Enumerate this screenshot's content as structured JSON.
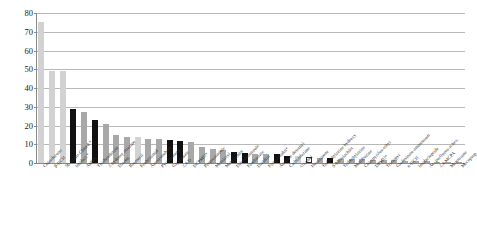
{
  "chart_data": {
    "type": "bar",
    "title": "",
    "subtitle": "",
    "xlabel": "",
    "ylabel": "",
    "ylim": [
      0,
      80
    ],
    "ytick_step": 10,
    "ytick_labels": [
      "0",
      "10",
      "20",
      "30",
      "40",
      "50",
      "60",
      "70",
      "80"
    ],
    "grid": true,
    "legend": "none",
    "colors": {
      "light": "#d2d2d2",
      "mid": "#a8a8a8",
      "dark": "#111111",
      "white": "#ffffff",
      "gridline": "#b9b9b9",
      "axis": "#8a8a8a"
    },
    "categories": [
      "Chlordecone",
      "β-HCH",
      "5b-hydro-Chlord.*",
      "Imidacl.*",
      "AMPA",
      "Thiabendazole",
      "2-hydroxy atrazine",
      "Diuron",
      "Bromacil",
      "Fenhexamid",
      "Azoxystrobine",
      "Pyrimethanil",
      "Glyphosate",
      "2,4-D",
      "DCPMU*",
      "Propiconazole",
      "Metalaxyl",
      "Metolachlor",
      "Difenoconazole",
      "Fosthiazate",
      "Dieldrin",
      "Flurprimidol*",
      "Atrazine desethyl",
      "Carbendazime",
      "Oxamyl",
      "Hexazinone",
      "Terbuthylazine hydroxy",
      "S-Metolachlor",
      "Terbuthylazine",
      "Metribuzine",
      "Chlorpyrifos-ethyl",
      "DPMU*",
      "Triclopyr",
      "Glufosinate-ammonium",
      "α-HCH",
      "Imidaclopride",
      "Ac. perfluoro-n-hex.",
      "2,4-MCPA",
      "Mesotrione",
      "Mecoprop"
    ],
    "values": [
      75,
      49,
      49,
      29,
      27,
      23,
      21,
      15,
      14,
      14,
      13,
      13,
      12.5,
      12,
      11,
      8.5,
      7.5,
      7,
      6,
      5.5,
      5,
      5,
      4.8,
      4,
      3.5,
      3,
      2.8,
      2.6,
      2.4,
      2.2,
      2,
      1.8,
      1.6,
      1.4,
      1.2,
      1,
      0.9,
      0.8,
      0.6,
      0.5
    ],
    "bar_styles": [
      "light",
      "light",
      "light",
      "dark",
      "mid",
      "dark",
      "mid",
      "mid",
      "mid",
      "light",
      "mid",
      "mid",
      "dark",
      "dark",
      "mid",
      "mid",
      "mid",
      "mid",
      "dark",
      "dark",
      "mid",
      "mid",
      "dark",
      "dark",
      "light",
      "white",
      "mid",
      "dark",
      "mid",
      "mid",
      "mid",
      "mid",
      "mid",
      "mid",
      "mid",
      "mid",
      "mid",
      "mid",
      "mid",
      "mid"
    ]
  }
}
